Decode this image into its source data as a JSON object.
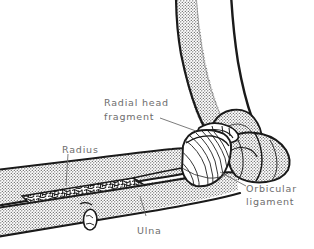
{
  "figure": {
    "view": "lateral oblique view of right elbow",
    "background_color": "#ffffff",
    "ink_color": "#1a1a1a",
    "label_color": "#6d6d6d",
    "stipple_color": "#555555"
  },
  "labels": {
    "radial_head_fragment": {
      "line1": "Radial head",
      "line2": "fragment"
    },
    "radius": "Radius",
    "orbicular_ligament": {
      "line1": "Orbicular",
      "line2": "ligament"
    },
    "ulna": "Ulna"
  },
  "structures": [
    {
      "name": "humerus",
      "fill": "stipple",
      "description": "distal humerus shaft descending from top of frame"
    },
    {
      "name": "radius",
      "fill": "stipple",
      "description": "radius shaft extending to the left, cut away to reveal cancellous bone"
    },
    {
      "name": "radius-cancellous-window",
      "fill": "trabecular",
      "description": "cut-away window in radius showing trabecular bone"
    },
    {
      "name": "ulna",
      "fill": "stipple",
      "description": "ulna shaft below the radius running to lower left"
    },
    {
      "name": "olecranon",
      "fill": "stipple",
      "description": "olecranon process of ulna at right of joint"
    },
    {
      "name": "radial-head-fragment",
      "fill": "white",
      "description": "displaced wedge-shaped fragment of radial head"
    },
    {
      "name": "orbicular-ligament",
      "fill": "fiber-lines",
      "description": "annular (orbicular) ligament encircling the radial neck"
    }
  ]
}
